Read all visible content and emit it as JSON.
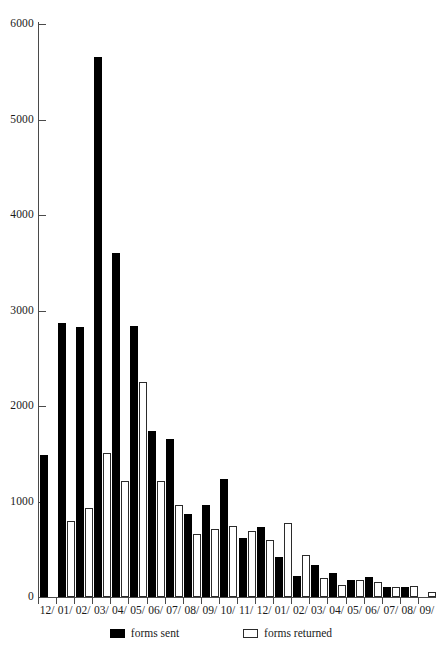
{
  "chart_data": {
    "type": "bar",
    "title": "",
    "subtitle": "",
    "xlabel": "",
    "ylabel": "",
    "ylim": [
      0,
      6000
    ],
    "ytick_values": [
      0,
      1000,
      2000,
      3000,
      4000,
      5000,
      6000
    ],
    "ytick_labels": [
      "0",
      "1000",
      "2000",
      "3000",
      "4000",
      "5000",
      "6000"
    ],
    "grid": false,
    "legend_position": "bottom",
    "categories": [
      "12/",
      "01/",
      "02/",
      "03/",
      "04/",
      "05/",
      "06/",
      "07/",
      "08/",
      "09/",
      "10/",
      "11/",
      "12/",
      "01/",
      "02/",
      "03/",
      "04/",
      "05/",
      "06/",
      "07/",
      "08/",
      "09/"
    ],
    "series": [
      {
        "name": "forms sent",
        "color": "#000000",
        "values": [
          1490,
          2870,
          2830,
          5650,
          3600,
          2840,
          1740,
          1650,
          870,
          960,
          1240,
          620,
          730,
          420,
          220,
          340,
          250,
          180,
          210,
          100,
          110,
          0
        ]
      },
      {
        "name": "forms returned",
        "color": "#ffffff",
        "values": [
          0,
          800,
          930,
          1510,
          1220,
          2250,
          1210,
          960,
          660,
          710,
          740,
          690,
          600,
          780,
          440,
          200,
          130,
          180,
          160,
          110,
          120,
          50
        ]
      }
    ]
  },
  "legend": {
    "entries": [
      {
        "label": "forms sent"
      },
      {
        "label": "forms returned"
      }
    ]
  }
}
